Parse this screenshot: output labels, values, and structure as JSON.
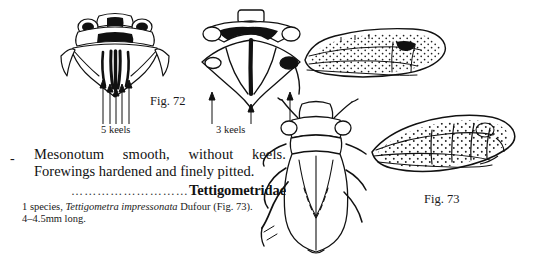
{
  "page": {
    "background": "#ffffff",
    "ink": "#111111"
  },
  "figures": {
    "fig72": {
      "caption": "Fig. 72",
      "left_panel": {
        "name": "mesonotum-with-5-keels",
        "label": "5 keels",
        "arrow_count": 5
      },
      "right_panel": {
        "name": "mesonotum-with-3-keels",
        "label": "3 keels",
        "arrow_count": 3
      }
    },
    "fig73": {
      "caption": "Fig. 73",
      "panels": [
        {
          "name": "forewing-upper",
          "description": "forewing-hardened-pitted"
        },
        {
          "name": "habitus-dorsal",
          "description": "whole-insect-dorsal-view"
        },
        {
          "name": "forewing-lower",
          "description": "forewing-hardened-pitted"
        }
      ]
    }
  },
  "couplet": {
    "marker": "-",
    "line1": "Mesonotum  smooth,  without  keels.",
    "line2": "Forewings hardened and finely pitted.",
    "leader": "………………………",
    "family": "Tettigometridae",
    "note_prefix": "1 species, ",
    "note_species": "Tettigometra impressonata",
    "note_suffix": " Dufour (Fig. 73). 4–4.5mm long."
  }
}
